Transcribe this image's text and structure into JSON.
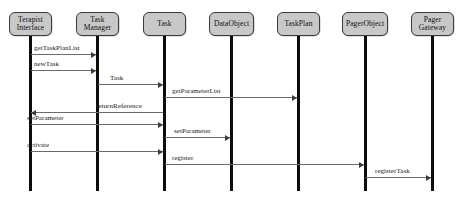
{
  "diagram": {
    "type": "uml-sequence-diagram",
    "background_color": "#ffffff",
    "lifeline_fill_color": "#c8c8c8",
    "lifeline_border_color": "#3a3a3a",
    "activation_bar_color": "#0d0d0d",
    "message_line_color": "#6b6b6b"
  },
  "lifelines": [
    {
      "id": "terapist-interface",
      "label_line1": "Terapist",
      "label_line2": "Interface",
      "x": 30,
      "box_left": 9,
      "box_width": 43,
      "box_top": 12,
      "box_height": 24,
      "bar_top": 36,
      "bar_height": 155
    },
    {
      "id": "task-manager",
      "label_line1": "Task",
      "label_line2": "Manager",
      "x": 97,
      "box_left": 76,
      "box_width": 43,
      "box_top": 12,
      "box_height": 24,
      "bar_top": 36,
      "bar_height": 155
    },
    {
      "id": "task",
      "label_line1": "Task",
      "label_line2": "",
      "x": 164,
      "box_left": 143,
      "box_width": 43,
      "box_top": 12,
      "box_height": 24,
      "bar_top": 36,
      "bar_height": 155
    },
    {
      "id": "data-object",
      "label_line1": "DataObject",
      "label_line2": "",
      "x": 231,
      "box_left": 209,
      "box_width": 45,
      "box_top": 12,
      "box_height": 24,
      "bar_top": 36,
      "bar_height": 155
    },
    {
      "id": "task-plan",
      "label_line1": "TaskPlan",
      "label_line2": "",
      "x": 298,
      "box_left": 277,
      "box_width": 43,
      "box_top": 12,
      "box_height": 24,
      "bar_top": 36,
      "bar_height": 155
    },
    {
      "id": "pager-object",
      "label_line1": "PagerObject",
      "label_line2": "",
      "x": 365,
      "box_left": 342,
      "box_width": 46,
      "box_top": 12,
      "box_height": 24,
      "bar_top": 36,
      "bar_height": 155
    },
    {
      "id": "pager-gateway",
      "label_line1": "Pager",
      "label_line2": "Gateway",
      "x": 432,
      "box_left": 411,
      "box_width": 43,
      "box_top": 12,
      "box_height": 24,
      "bar_top": 36,
      "bar_height": 155
    }
  ],
  "messages": [
    {
      "id": "get-task-plan-list",
      "label": "getTaskPlanList",
      "from": "terapist-interface",
      "to": "task-manager",
      "direction": "right",
      "y": 54,
      "x_start": 31,
      "x_end": 96,
      "label_x": 34,
      "label_y": 44
    },
    {
      "id": "new-task",
      "label": "newTask",
      "from": "terapist-interface",
      "to": "task-manager",
      "direction": "right",
      "y": 70,
      "x_start": 31,
      "x_end": 96,
      "label_x": 34,
      "label_y": 60
    },
    {
      "id": "task-create",
      "label": "Task",
      "from": "task-manager",
      "to": "task",
      "direction": "right",
      "y": 84,
      "x_start": 98,
      "x_end": 163,
      "label_x": 110,
      "label_y": 74
    },
    {
      "id": "get-parameter-list",
      "label": "getParameterList",
      "from": "task",
      "to": "task-plan",
      "direction": "right",
      "y": 97,
      "x_start": 165,
      "x_end": 297,
      "label_x": 172,
      "label_y": 87
    },
    {
      "id": "return-reference",
      "label": "returnReference",
      "from": "task-manager",
      "to": "terapist-interface",
      "direction": "left",
      "y": 112,
      "x_start": 31,
      "x_end": 163,
      "label_x": 96,
      "label_y": 102
    },
    {
      "id": "set-parameter-ui",
      "label": "setParameter",
      "from": "terapist-interface",
      "to": "task",
      "direction": "right",
      "y": 124,
      "x_start": 31,
      "x_end": 163,
      "label_x": 27,
      "label_y": 114
    },
    {
      "id": "set-parameter-data",
      "label": "setParameter",
      "from": "task",
      "to": "data-object",
      "direction": "right",
      "y": 137,
      "x_start": 165,
      "x_end": 230,
      "label_x": 174,
      "label_y": 127
    },
    {
      "id": "activate",
      "label": "activate",
      "from": "terapist-interface",
      "to": "task",
      "direction": "right",
      "y": 151,
      "x_start": 31,
      "x_end": 163,
      "label_x": 27,
      "label_y": 141
    },
    {
      "id": "register",
      "label": "register",
      "from": "task",
      "to": "pager-object",
      "direction": "right",
      "y": 164,
      "x_start": 165,
      "x_end": 364,
      "label_x": 172,
      "label_y": 154
    },
    {
      "id": "register-task",
      "label": "registerTask",
      "from": "pager-object",
      "to": "pager-gateway",
      "direction": "right",
      "y": 177,
      "x_start": 366,
      "x_end": 431,
      "label_x": 375,
      "label_y": 167
    }
  ]
}
